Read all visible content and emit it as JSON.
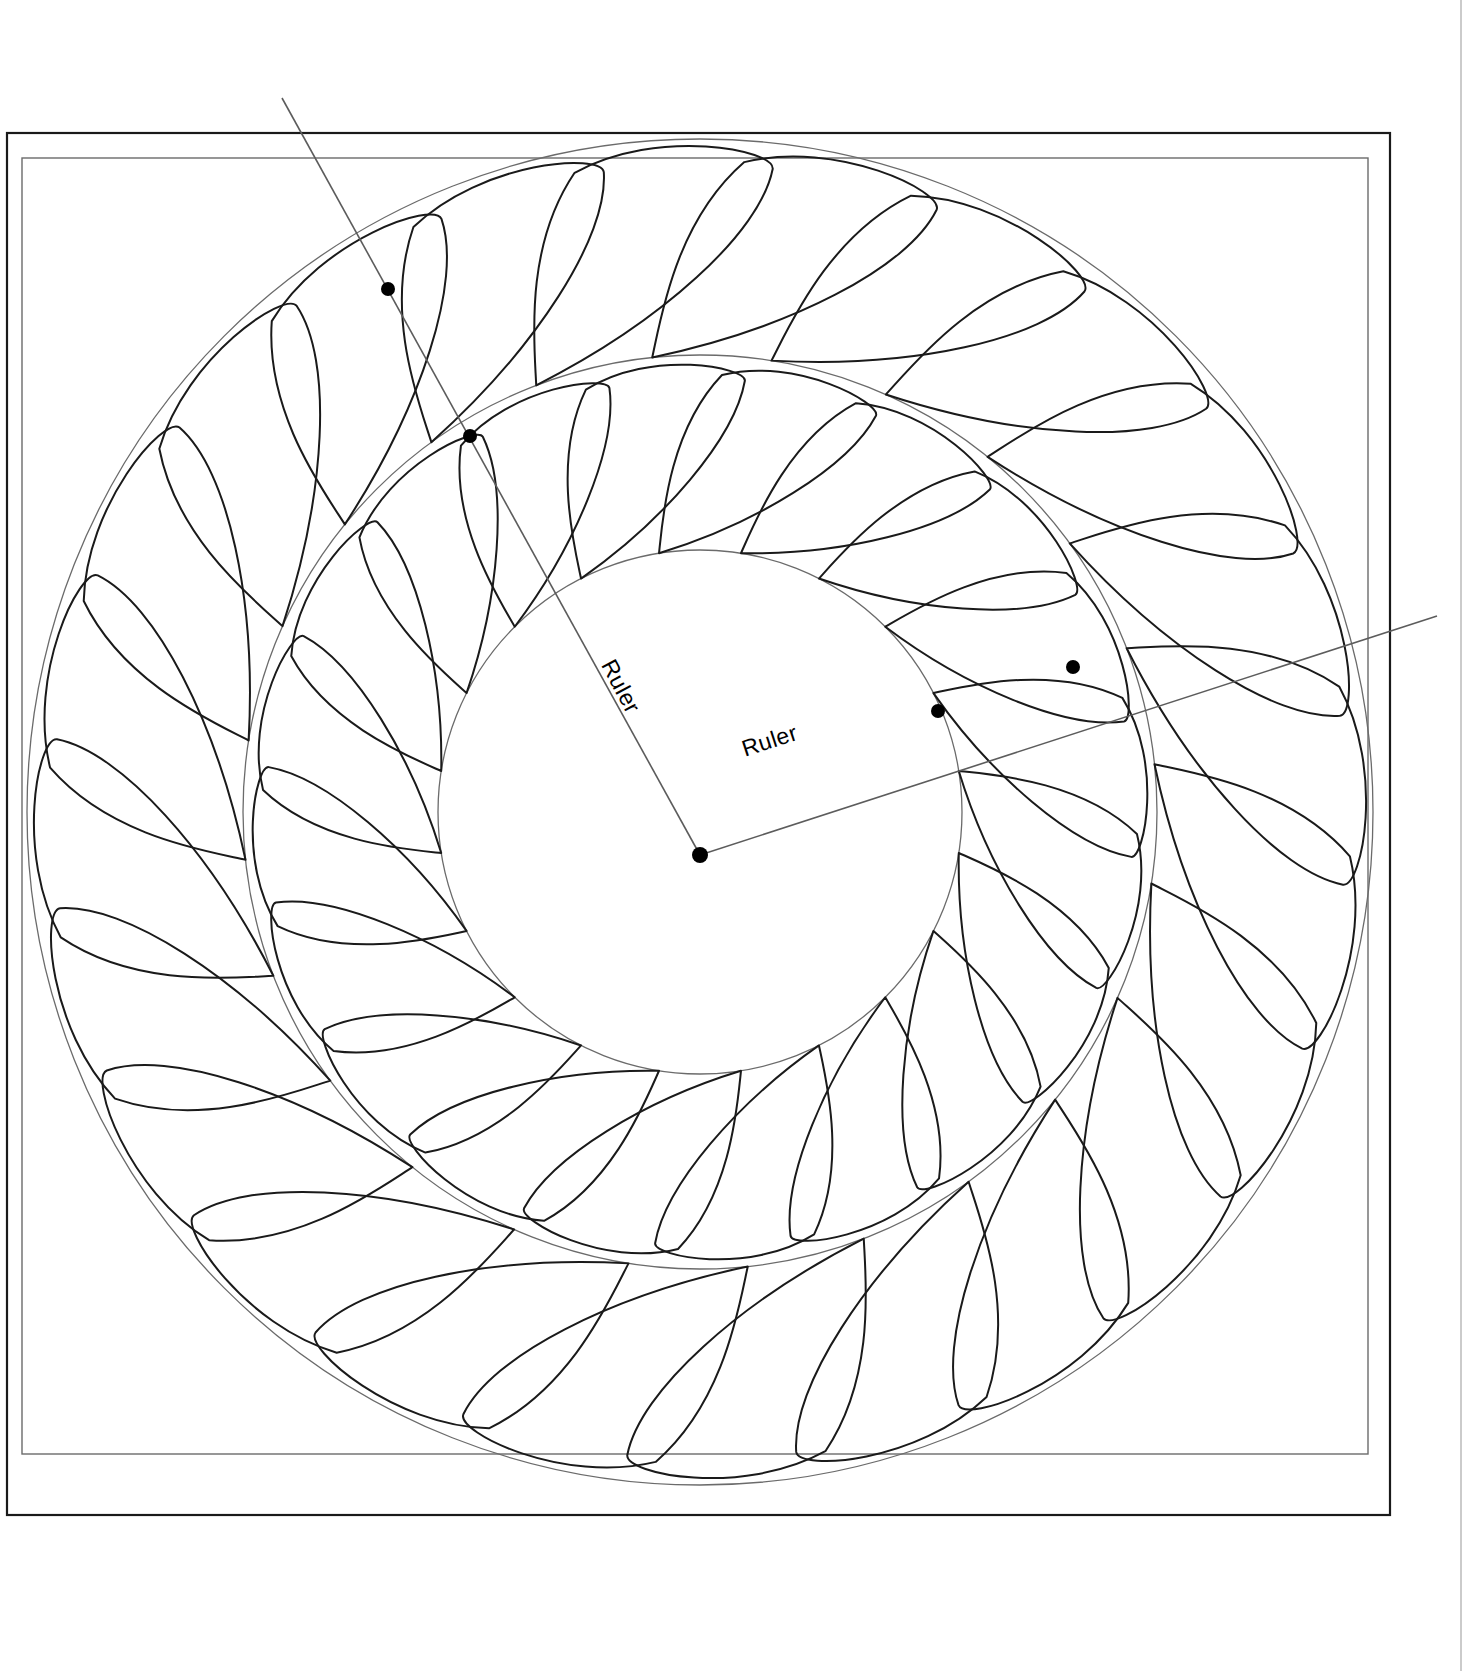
{
  "document": {
    "title": "Feather Wreath Quilting Pattern",
    "background_color": "#ffffff"
  },
  "frame": {
    "outer_border": {
      "name": "outer-border",
      "x": 7,
      "y": 133,
      "width": 1383,
      "height": 1382,
      "stroke": "#1a1a1a",
      "stroke_width": 2.2
    },
    "inner_border": {
      "name": "inner-border",
      "x": 22,
      "y": 158,
      "width": 1346,
      "height": 1296,
      "stroke": "#6b6b6b",
      "stroke_width": 1.4
    },
    "right_edge_line": {
      "name": "right-page-edge",
      "x": 1461,
      "y1": 0,
      "y2": 1671,
      "stroke": "#a8a8a8",
      "stroke_width": 1.2
    }
  },
  "geometry": {
    "center": {
      "x": 700,
      "y": 812
    },
    "center_dot": {
      "x": 700,
      "y": 855,
      "r": 8
    },
    "circles": [
      {
        "name": "outer-guide-circle",
        "cx": 700,
        "cy": 812,
        "r": 673,
        "stroke": "#6b6b6b",
        "stroke_width": 1.3
      },
      {
        "name": "middle-guide-circle",
        "cx": 700,
        "cy": 812,
        "r": 457,
        "stroke": "#6b6b6b",
        "stroke_width": 1.3
      },
      {
        "name": "inner-guide-circle",
        "cx": 700,
        "cy": 812,
        "r": 262,
        "stroke": "#6b6b6b",
        "stroke_width": 1.3
      }
    ]
  },
  "feathers": {
    "outer_ring": {
      "name": "outer-feather-ring",
      "petal_count": 24,
      "inner_radius": 457,
      "outer_radius": 673,
      "start_angle_deg": -96,
      "direction": "clockwise",
      "stroke": "#1a1a1a",
      "stroke_width": 2.0,
      "fill": "none"
    },
    "inner_ring": {
      "name": "inner-feather-ring",
      "petal_count": 20,
      "inner_radius": 262,
      "outer_radius": 457,
      "start_angle_deg": -99,
      "direction": "clockwise",
      "stroke": "#1a1a1a",
      "stroke_width": 2.0,
      "fill": "none"
    }
  },
  "rulers": [
    {
      "name": "ruler-upper-left",
      "label": "Ruler",
      "label_x": 614,
      "label_y": 690,
      "label_rotation_deg": 62,
      "from": {
        "x": 700,
        "y": 855
      },
      "to": {
        "x": 282,
        "y": 98
      },
      "stroke": "#5c5c5c",
      "stroke_width": 1.6,
      "markers": [
        {
          "name": "ruler-marker-outer-ul",
          "x": 388,
          "y": 289,
          "r": 7
        },
        {
          "name": "ruler-marker-inner-ul",
          "x": 470,
          "y": 436,
          "r": 7
        }
      ]
    },
    {
      "name": "ruler-lower-right",
      "label": "Ruler",
      "label_x": 772,
      "label_y": 748,
      "label_rotation_deg": -18,
      "from": {
        "x": 700,
        "y": 855
      },
      "to": {
        "x": 1437,
        "y": 616
      },
      "stroke": "#5c5c5c",
      "stroke_width": 1.6,
      "markers": [
        {
          "name": "ruler-marker-inner-lr",
          "x": 938,
          "y": 711,
          "r": 7
        },
        {
          "name": "ruler-marker-outer-lr",
          "x": 1073,
          "y": 667,
          "r": 7
        }
      ]
    }
  ],
  "colors": {
    "ink": "#1a1a1a",
    "guide": "#6b6b6b",
    "ruler": "#5c5c5c",
    "marker": "#000000",
    "paper": "#ffffff"
  },
  "labels": {
    "ruler_text": "Ruler"
  }
}
